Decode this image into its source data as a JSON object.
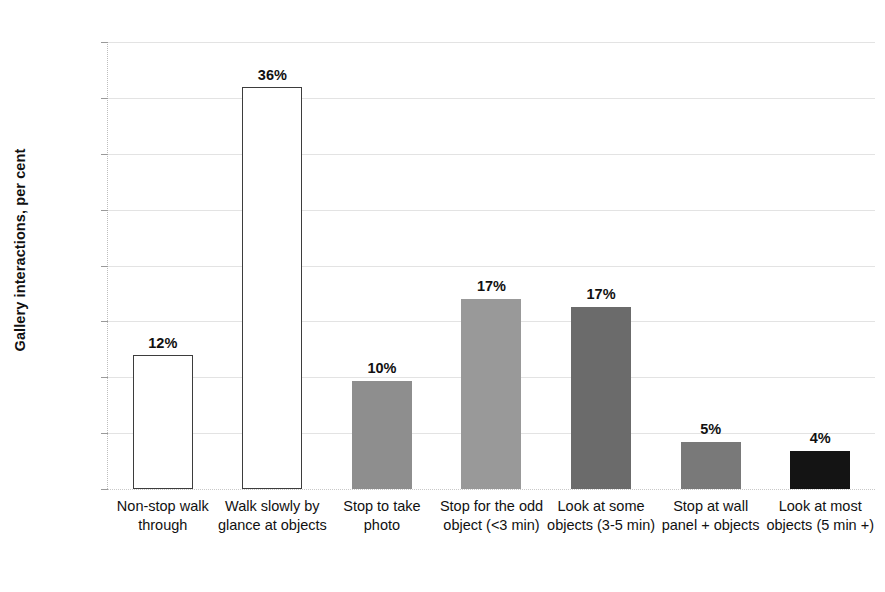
{
  "chart_data": {
    "type": "bar",
    "title": "",
    "xlabel": "",
    "ylabel": "Gallery interactions, per cent",
    "ylim": [
      0,
      40
    ],
    "ytick_labels": [
      "40%",
      "35%",
      "30%",
      "25%",
      "20%",
      "15%",
      "10%",
      "5%",
      "0%"
    ],
    "ytick_values": [
      40,
      35,
      30,
      25,
      20,
      15,
      10,
      5,
      0
    ],
    "grid": true,
    "legend": "none",
    "categories": [
      "Non-stop walk through",
      "Walk slowly by glance at objects",
      "Stop to take photo",
      "Stop for the odd object (<3 min)",
      "Look at some objects (3-5 min)",
      "Stop at wall panel + objects",
      "Look at most objects (5 min +)"
    ],
    "values": [
      12,
      36,
      10,
      17,
      17,
      5,
      4
    ],
    "data_labels": [
      "12%",
      "36%",
      "10%",
      "17%",
      "17%",
      "5%",
      "4%"
    ],
    "drawn_heights": [
      12.0,
      36.0,
      9.7,
      17.0,
      16.3,
      4.2,
      3.4
    ],
    "bar_styles": [
      "outlined",
      "outlined",
      "filled",
      "filled",
      "filled",
      "filled",
      "filled"
    ],
    "bar_colors": [
      "#ffffff",
      "#ffffff",
      "#8e8e8e",
      "#999999",
      "#6b6b6b",
      "#797979",
      "#141414"
    ]
  }
}
